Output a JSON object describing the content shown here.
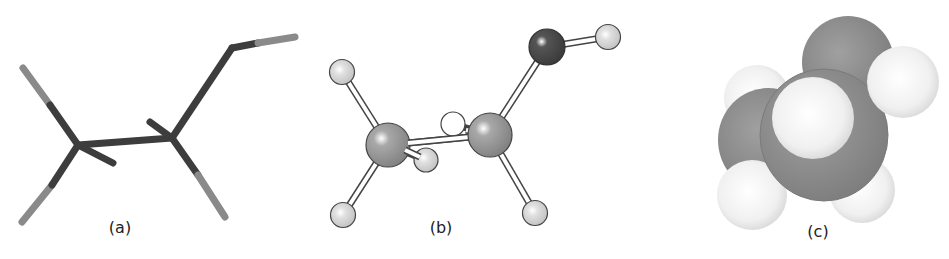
{
  "figure": {
    "panels": [
      {
        "id": "a",
        "label": "(a)",
        "style": "stick (wireframe) model"
      },
      {
        "id": "b",
        "label": "(b)",
        "style": "ball-and-stick model"
      },
      {
        "id": "c",
        "label": "(c)",
        "style": "space-filling model"
      }
    ]
  },
  "colors": {
    "carbon_stick": "#3d3d3d",
    "hydrogen_stick": "#8a8a8a",
    "carbon_ball": "#8f8f8f",
    "oxygen_ball": "#4a4a4a",
    "hydrogen_ball": "#d4d4d4",
    "hydrogen_white": "#ffffff",
    "spacefill_gray": "#8c8c8c",
    "spacefill_h": "#f2f2f2"
  }
}
